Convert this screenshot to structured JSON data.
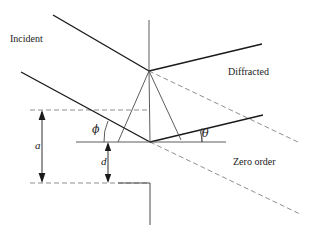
{
  "figure": {
    "background_color": "#ffffff",
    "stroke_color": "#1a1a1a",
    "dashed_color": "#8a8a8a",
    "thin_color": "#555555"
  },
  "labels": {
    "incident": "Incident",
    "diffracted": "Diffracted",
    "zero_order": "Zero order",
    "phi": "ϕ",
    "theta": "θ",
    "a": "a",
    "d": "d"
  },
  "geometry": {
    "apex": {
      "x": 149,
      "y": 71
    },
    "groove_bottom": {
      "x": 150,
      "y": 142
    },
    "normal_top": {
      "x": 149,
      "y": 20
    },
    "incident_upper_start": {
      "x": 53,
      "y": 15
    },
    "incident_lower_start": {
      "x": 21,
      "y": 72
    },
    "diffracted_upper_end": {
      "x": 262,
      "y": 44
    },
    "diffracted_lower_end": {
      "x": 263,
      "y": 115
    },
    "zero_order_upper_end": {
      "x": 300,
      "y": 143
    },
    "zero_order_lower_end": {
      "x": 300,
      "y": 214
    },
    "baseline_y": 142,
    "top_reference_y": 110,
    "bottom_reference_y": 183,
    "dim_a_x": 42,
    "dim_d_x": 108,
    "step_vertical_x": 150,
    "step_bottom_y": 225
  },
  "dimensions": {
    "a_label": "a",
    "a_from_y": 110,
    "a_to_y": 182,
    "d_label": "d",
    "d_from_y": 142,
    "d_to_y": 182
  },
  "angles": {
    "phi_label": "ϕ",
    "phi_arc_radius": 46,
    "theta_label": "θ",
    "theta_arc_radius": 52
  }
}
